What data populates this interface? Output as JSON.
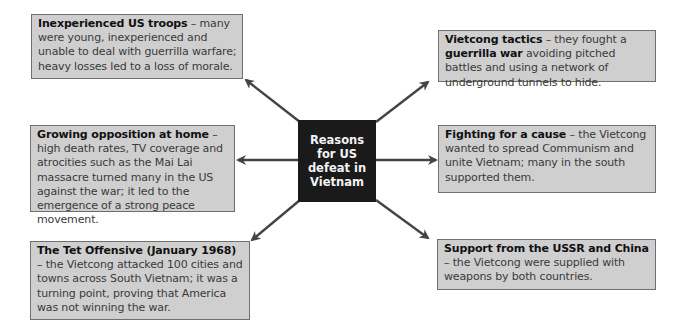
{
  "center": {
    "title": "Reasons for US defeat in Vietnam"
  },
  "colors": {
    "box_fill": "#cfcfcf",
    "box_border": "#6e6e6e",
    "center_fill": "#1a1a1a",
    "center_text": "#f2f2f2",
    "arrow": "#444444"
  },
  "reasons": {
    "troops": {
      "heading": "Inexperienced US troops",
      "text": " – many were young, inexperienced and unable to deal with guerrilla warfare; heavy losses led to a loss of morale."
    },
    "opposition": {
      "heading": "Growing opposition at home",
      "text": " – high death rates, TV coverage and atrocities such as the Mai Lai massacre turned many in the US against the war; it led to the emergence of a strong peace movement."
    },
    "tet": {
      "heading": "The Tet Offensive (January 1968)",
      "text": " – the Vietcong attacked 100 cities and towns across South Vietnam; it was a turning point, proving that America was not winning the war."
    },
    "tactics": {
      "heading": "Vietcong tactics",
      "text_before": " – they fought a ",
      "bold_term": "guerrilla war",
      "text_after": " avoiding pitched battles and using a network of underground tunnels to hide."
    },
    "cause": {
      "heading": "Fighting for a cause",
      "text": " – the Vietcong wanted to spread Communism and unite Vietnam; many in the south supported them."
    },
    "support": {
      "heading": "Support from the USSR and China",
      "text": " – the Vietcong were supplied with weapons by both countries."
    }
  }
}
